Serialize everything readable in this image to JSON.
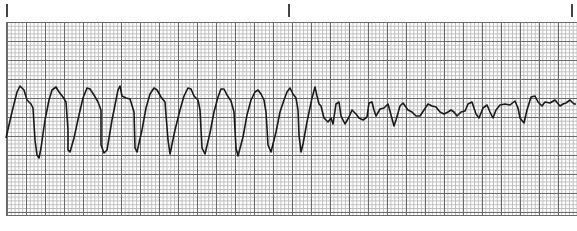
{
  "strip": {
    "type": "ECG rhythm strip",
    "time_markers_px": [
      6,
      288,
      572
    ],
    "grid": {
      "small_box_px": 3.8,
      "large_box_px": 19,
      "line_color": "#6a6a6a",
      "minor_color": "#bdbdbd"
    },
    "trace_color": "#1a1a1a",
    "segments": [
      {
        "label": "wide-complex tachycardia",
        "x_range": [
          6,
          300
        ],
        "complexes": 9
      },
      {
        "label": "chaotic low-amplitude fibrillatory waves",
        "x_range": [
          300,
          576
        ]
      }
    ]
  },
  "caption": {
    "text": ""
  }
}
